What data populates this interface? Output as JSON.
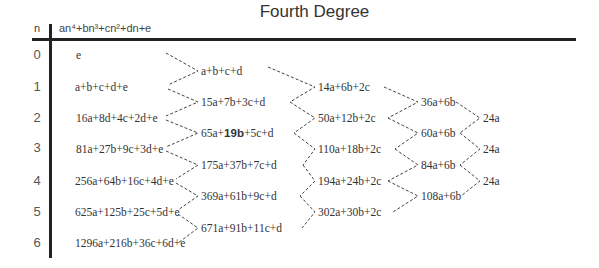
{
  "title": "Fourth Degree",
  "header": {
    "n_label": "n",
    "formula": "an⁴+bn³+cn²+dn+e"
  },
  "rows": [
    {
      "n": "0",
      "value": "e"
    },
    {
      "n": "1",
      "value": "a+b+c+d+e"
    },
    {
      "n": "2",
      "value": "16a+8d+4c+2d+e"
    },
    {
      "n": "3",
      "value": "81a+27b+9c+3d+e"
    },
    {
      "n": "4",
      "value": "256a+64b+16c+4d+e"
    },
    {
      "n": "5",
      "value": "625a+125b+25c+5d+e"
    },
    {
      "n": "6",
      "value": "1296a+216b+36c+6d+e"
    }
  ],
  "differences": {
    "first": [
      {
        "value": "a+b+c+d"
      },
      {
        "value": "15a+7b+3c+d"
      },
      {
        "pre": "65a+",
        "bold": "19b",
        "post": "+5c+d"
      },
      {
        "value": "175a+37b+7c+d"
      },
      {
        "value": "369a+61b+9c+d"
      },
      {
        "value": "671a+91b+11c+d"
      }
    ],
    "second": [
      {
        "value": "14a+6b+2c"
      },
      {
        "value": "50a+12b+2c"
      },
      {
        "value": "110a+18b+2c"
      },
      {
        "value": "194a+24b+2c"
      },
      {
        "value": "302a+30b+2c"
      }
    ],
    "third": [
      {
        "value": "36a+6b"
      },
      {
        "value": "60a+6b"
      },
      {
        "value": "84a+6b"
      },
      {
        "value": "108a+6b"
      }
    ],
    "fourth": [
      {
        "value": "24a"
      },
      {
        "value": "24a"
      },
      {
        "value": "24a"
      }
    ]
  },
  "colors": {
    "text": "#333333",
    "rule": "#222222",
    "connector": "#444444"
  }
}
